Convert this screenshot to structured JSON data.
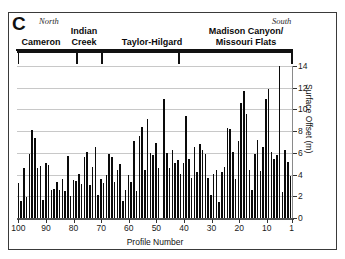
{
  "figure": {
    "panel_label": "C",
    "orientation_left": "North",
    "orientation_right": "South"
  },
  "segments": [
    {
      "label": "Cameron"
    },
    {
      "label": "Indian\nCreek"
    },
    {
      "label": "Taylor-Hilgard"
    },
    {
      "label": "Madison Canyon/\nMissouri Flats"
    }
  ],
  "chart_data": {
    "type": "bar",
    "title": "",
    "xlabel": "Profile Number",
    "ylabel": "Surface Offset (m)",
    "ylim": [
      0,
      14
    ],
    "yticks": [
      0,
      2,
      4,
      6,
      8,
      10,
      12,
      14
    ],
    "xticks": [
      100,
      90,
      80,
      70,
      60,
      50,
      40,
      30,
      20,
      10,
      1
    ],
    "x_axis_reversed": true,
    "grid": true,
    "legend": "none",
    "x": [
      100,
      99,
      98,
      97,
      96,
      95,
      94,
      93,
      92,
      91,
      90,
      89,
      88,
      87,
      86,
      85,
      84,
      83,
      82,
      81,
      80,
      79,
      78,
      77,
      76,
      75,
      74,
      73,
      72,
      71,
      70,
      69,
      68,
      67,
      66,
      65,
      64,
      63,
      62,
      61,
      60,
      59,
      58,
      57,
      56,
      55,
      54,
      53,
      52,
      51,
      50,
      49,
      48,
      47,
      46,
      45,
      44,
      43,
      42,
      41,
      40,
      39,
      38,
      37,
      36,
      35,
      34,
      33,
      32,
      31,
      30,
      29,
      28,
      27,
      26,
      25,
      24,
      23,
      22,
      21,
      20,
      19,
      18,
      17,
      16,
      15,
      14,
      13,
      12,
      11,
      10,
      9,
      8,
      7,
      6,
      5,
      4,
      3,
      2,
      1
    ],
    "values": [
      3.2,
      1.6,
      4.6,
      1.9,
      5.9,
      8.1,
      7.4,
      4.6,
      4.8,
      1.7,
      5.1,
      4.9,
      2.6,
      2.7,
      3.3,
      2.6,
      3.6,
      2.5,
      5.7,
      2.0,
      3.5,
      3.4,
      4.1,
      3.1,
      5.6,
      6.1,
      3.0,
      4.7,
      6.5,
      2.1,
      3.6,
      3.2,
      4.0,
      5.9,
      5.6,
      3.3,
      4.4,
      5.0,
      1.6,
      2.6,
      4.0,
      3.3,
      7.1,
      2.5,
      7.6,
      8.4,
      4.4,
      9.1,
      6.0,
      5.8,
      6.9,
      4.6,
      0.0,
      11.0,
      6.0,
      4.6,
      6.3,
      5.1,
      5.3,
      4.1,
      5.1,
      9.4,
      5.4,
      3.7,
      6.5,
      4.2,
      6.8,
      6.3,
      5.9,
      3.7,
      2.1,
      4.1,
      4.4,
      1.5,
      4.2,
      4.7,
      8.3,
      8.2,
      6.1,
      3.6,
      7.1,
      10.6,
      11.7,
      9.6,
      4.4,
      2.6,
      5.9,
      7.2,
      4.3,
      6.5,
      11.0,
      11.9,
      6.1,
      5.4,
      5.8,
      14.0,
      2.4,
      6.3,
      5.2,
      3.9
    ]
  }
}
